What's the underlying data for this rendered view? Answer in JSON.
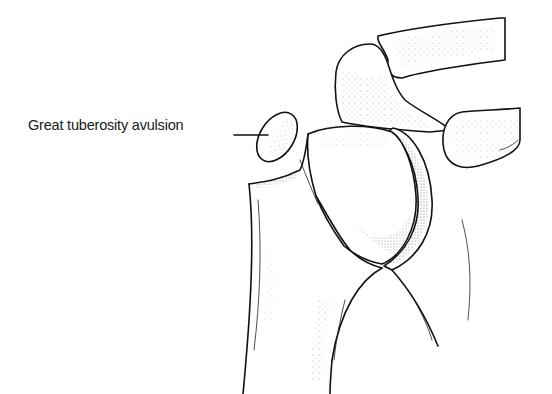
{
  "figure": {
    "type": "anatomical line illustration",
    "annotation": {
      "label": "Great tuberosity avulsion",
      "leader_line": true
    }
  }
}
